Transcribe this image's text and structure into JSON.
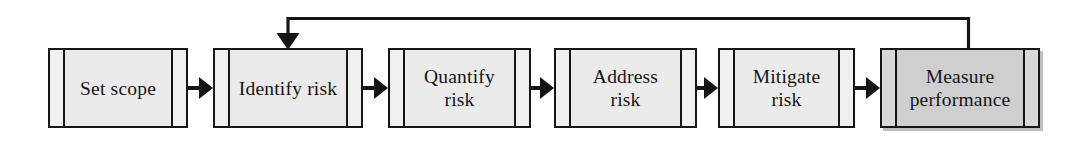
{
  "diagram": {
    "type": "linear-process-flow-with-feedback-loop",
    "colors": {
      "stroke": "#151515",
      "box_fill": "#ebebeb",
      "box_fill_highlight": "#cfcfcf",
      "edge_strip_fill": "#f0f0f0",
      "background": "#ffffff"
    },
    "steps": [
      {
        "id": "set-scope",
        "label": "Set scope",
        "highlight": false,
        "x": 48,
        "width": 140
      },
      {
        "id": "identify-risk",
        "label": "Identify risk",
        "highlight": false,
        "x": 213,
        "width": 150
      },
      {
        "id": "quantify-risk",
        "label": "Quantify\nrisk",
        "highlight": false,
        "x": 388,
        "width": 143
      },
      {
        "id": "address-risk",
        "label": "Address\nrisk",
        "highlight": false,
        "x": 554,
        "width": 143
      },
      {
        "id": "mitigate-risk",
        "label": "Mitigate\nrisk",
        "highlight": false,
        "x": 718,
        "width": 137
      },
      {
        "id": "measure-performance",
        "label": "Measure\nperformance",
        "highlight": true,
        "x": 880,
        "width": 160
      }
    ],
    "connectors": [
      {
        "id": "arrow-set-scope-to-identify-risk",
        "from": "set-scope",
        "to": "identify-risk",
        "x": 188,
        "width": 25
      },
      {
        "id": "arrow-identify-risk-to-quantify-risk",
        "from": "identify-risk",
        "to": "quantify-risk",
        "x": 363,
        "width": 25
      },
      {
        "id": "arrow-quantify-risk-to-address-risk",
        "from": "quantify-risk",
        "to": "address-risk",
        "x": 531,
        "width": 23
      },
      {
        "id": "arrow-address-risk-to-mitigate-risk",
        "from": "address-risk",
        "to": "mitigate-risk",
        "x": 697,
        "width": 21
      },
      {
        "id": "arrow-mitigate-risk-to-measure-perf",
        "from": "mitigate-risk",
        "to": "measure-performance",
        "x": 855,
        "width": 25
      }
    ],
    "feedback": {
      "id": "feedback-loop-measure-performance-to-identify-risk",
      "from": "measure-performance",
      "to": "identify-risk",
      "label": "",
      "path_points": "968,48 968,18 288,18 288,42",
      "arrow_direction": "down-into-identify-risk"
    }
  }
}
